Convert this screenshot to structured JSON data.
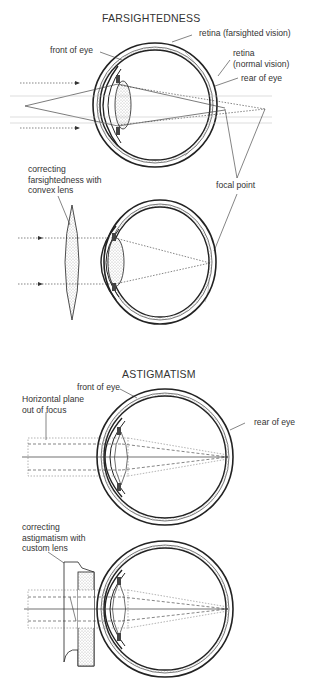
{
  "farsightedness": {
    "title": "FARSIGHTEDNESS",
    "labels": {
      "retina_farsighted": "retina (farsighted vision)",
      "front_of_eye": "front of eye",
      "retina_normal_line1": "retina",
      "retina_normal_line2": "(normal vision)",
      "rear_of_eye": "rear of eye",
      "correcting_line1": "correcting",
      "correcting_line2": "farsightedness with",
      "correcting_line3": "convex lens",
      "focal_point": "focal point"
    }
  },
  "astigmatism": {
    "title": "ASTIGMATISM",
    "labels": {
      "front_of_eye": "front of eye",
      "horizontal_line1": "Horizontal plane",
      "horizontal_line2": "out of focus",
      "rear_of_eye": "rear of eye",
      "correcting_line1": "correcting",
      "correcting_line2": "astigmatism with",
      "correcting_line3": "custom lens"
    }
  }
}
